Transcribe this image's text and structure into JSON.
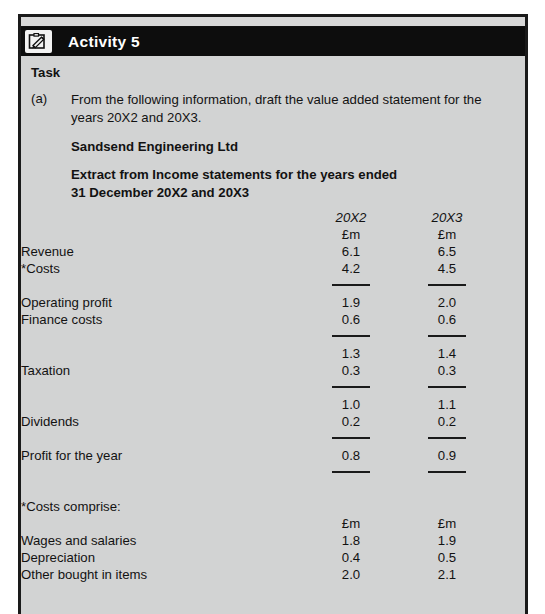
{
  "activity": {
    "title": "Activity 5",
    "icon": "clipboard-pencil-icon"
  },
  "task": {
    "heading": "Task",
    "marker": "(a)",
    "instruction": "From the following information, draft the value added statement for the years 20X2 and 20X3.",
    "company_name": "Sandsend Engineering Ltd",
    "extract_title_line1": "Extract from Income statements for the years ended",
    "extract_title_line2": "31 December 20X2 and 20X3"
  },
  "statement": {
    "column_headers": {
      "year_1": "20X2",
      "year_2": "20X3",
      "unit_1": "£m",
      "unit_2": "£m"
    },
    "rows": [
      {
        "label": "Revenue",
        "v1": "6.1",
        "v2": "6.5"
      },
      {
        "label": "*Costs",
        "v1": "4.2",
        "v2": "4.5"
      },
      {
        "label": "Operating profit",
        "v1": "1.9",
        "v2": "2.0"
      },
      {
        "label": "Finance costs",
        "v1": "0.6",
        "v2": "0.6"
      },
      {
        "label": "",
        "v1": "1.3",
        "v2": "1.4"
      },
      {
        "label": "Taxation",
        "v1": "0.3",
        "v2": "0.3"
      },
      {
        "label": "",
        "v1": "1.0",
        "v2": "1.1"
      },
      {
        "label": "Dividends",
        "v1": "0.2",
        "v2": "0.2"
      },
      {
        "label": "Profit for the year",
        "v1": "0.8",
        "v2": "0.9"
      }
    ]
  },
  "costs_note": {
    "heading": "*Costs comprise:",
    "unit_1": "£m",
    "unit_2": "£m",
    "rows": [
      {
        "label": "Wages and salaries",
        "v1": "1.8",
        "v2": "1.9"
      },
      {
        "label": "Depreciation",
        "v1": "0.4",
        "v2": "0.5"
      },
      {
        "label": "Other bought in items",
        "v1": "2.0",
        "v2": "2.1"
      }
    ]
  }
}
